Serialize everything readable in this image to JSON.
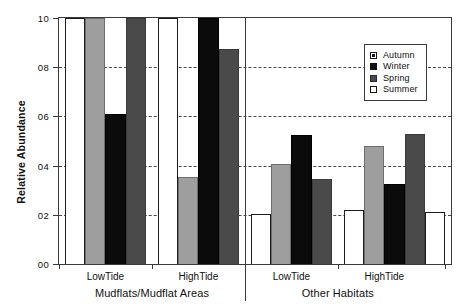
{
  "chart_data": {
    "type": "bar",
    "title": "",
    "xlabel": "",
    "ylabel": "Relative Abundance",
    "ylim": [
      0.0,
      1.0
    ],
    "ytick_labels": [
      "10",
      "08",
      "06",
      "04",
      "02",
      "00"
    ],
    "ytick_values": [
      1.0,
      0.8,
      0.6,
      0.4,
      0.2,
      0.0
    ],
    "grid": "horizontal-dashed",
    "gridline_values": [
      0.8,
      0.6,
      0.4,
      0.2
    ],
    "legend_position": "top-right",
    "legend": [
      "Autumn",
      "Winter",
      "Spring",
      "Summer"
    ],
    "super_groups": [
      {
        "label": "Mudflats/Mudflat Areas",
        "categories": [
          "LowTide",
          "HighTide"
        ]
      },
      {
        "label": "Other Habitats",
        "categories": [
          "LowTide",
          "HighTide"
        ]
      }
    ],
    "categories": [
      "LowTide",
      "HighTide",
      "LowTide",
      "HighTide"
    ],
    "series": [
      {
        "name": "Autumn",
        "color": "#ffffff",
        "values": [
          1.0,
          1.0,
          0.205,
          0.22
        ]
      },
      {
        "name": "Winter",
        "color": "#9e9e9e",
        "values": [
          1.0,
          0.355,
          0.405,
          0.48
        ]
      },
      {
        "name": "Spring",
        "color": "#0b0b0b",
        "values": [
          0.61,
          1.0,
          0.525,
          0.325
        ]
      },
      {
        "name": "Summer",
        "color": "#4a4a4a",
        "values": [
          1.0,
          0.875,
          0.345,
          0.53
        ]
      }
    ],
    "trailing_bar": {
      "name": "Autumn",
      "value": 0.21
    }
  }
}
